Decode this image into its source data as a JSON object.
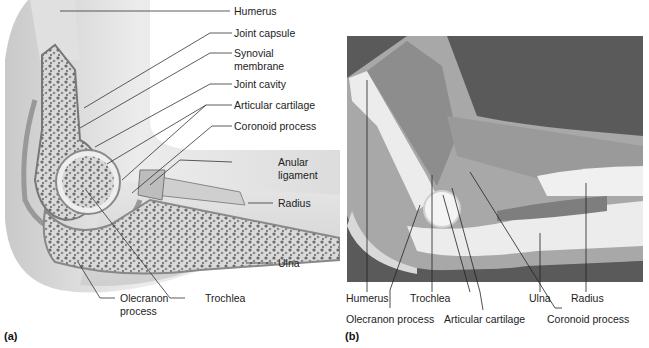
{
  "figure": {
    "panels": [
      {
        "id": "a",
        "panel_label": "(a)",
        "type": "illustration",
        "labels": {
          "humerus": "Humerus",
          "joint_capsule": "Joint capsule",
          "synovial_membrane_1": "Synovial",
          "synovial_membrane_2": "membrane",
          "joint_cavity": "Joint cavity",
          "articular_cartilage": "Articular cartilage",
          "coronoid_process": "Coronoid process",
          "anular_ligament_1": "Anular",
          "anular_ligament_2": "ligament",
          "radius": "Radius",
          "ulna": "Ulna",
          "olecranon_process_1": "Olecranon",
          "olecranon_process_2": "process",
          "trochlea": "Trochlea"
        }
      },
      {
        "id": "b",
        "panel_label": "(b)",
        "type": "photograph",
        "labels": {
          "humerus": "Humerus",
          "trochlea": "Trochlea",
          "ulna": "Ulna",
          "radius": "Radius",
          "olecranon_process": "Olecranon process",
          "articular_cartilage": "Articular cartilage",
          "coronoid_process": "Coronoid process"
        }
      }
    ]
  }
}
